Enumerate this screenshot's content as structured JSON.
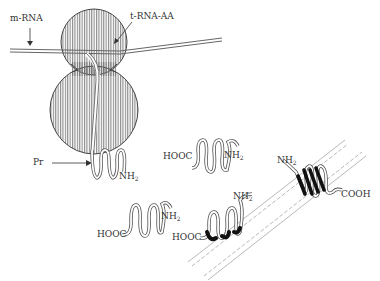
{
  "diagram": {
    "labels": {
      "mrna": "m-RNA",
      "trna": "t-RNA-AA",
      "pr": "Pr",
      "nh2_main": "NH",
      "hooc_top": "HOOC",
      "nh2_top": "NH",
      "hooc_left": "HOOC",
      "nh2_left": "NH",
      "hooc_mem1": "HOOC",
      "nh2_mem1": "NH",
      "nh2_mem2": "NH",
      "cooh_mem2": "COOH",
      "sub2": "2"
    },
    "colors": {
      "line": "#555555",
      "ribosome_hatch": "#777777",
      "helix_dark": "#111111",
      "membrane": "#aaaaaa"
    }
  }
}
